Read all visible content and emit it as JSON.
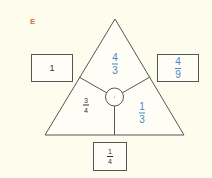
{
  "label": "E",
  "colors": {
    "background": "#fdfdee",
    "label": "#e0703a",
    "blue_text": "#4a86bf",
    "dark_text": "#333333",
    "lines": "#555555"
  },
  "triangle": {
    "top": {
      "numerator": "4",
      "denominator": "3",
      "color": "blue"
    },
    "bottom_left": {
      "numerator": "3",
      "denominator": "4",
      "color": "dark"
    },
    "bottom_right": {
      "numerator": "1",
      "denominator": "3",
      "color": "blue"
    },
    "center": "·"
  },
  "boxes": {
    "left": {
      "value": "1",
      "color": "dark"
    },
    "right": {
      "numerator": "4",
      "denominator": "9",
      "color": "blue"
    },
    "bottom": {
      "numerator": "1",
      "denominator": "4",
      "color": "dark"
    }
  }
}
